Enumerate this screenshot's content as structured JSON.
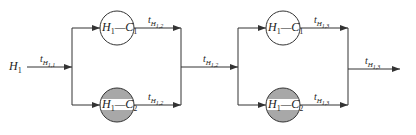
{
  "diagram": {
    "type": "series-parallel flow",
    "input": {
      "label_main": "H",
      "label_sub": "1"
    },
    "edges": {
      "input": {
        "t": "t",
        "H": "H",
        "sub": "1,1"
      },
      "stage1_top_out": {
        "t": "t",
        "H": "H",
        "sub": "1,2"
      },
      "stage1_bottom_out": {
        "t": "t",
        "H": "H",
        "sub": "1,2"
      },
      "middle": {
        "t": "t",
        "H": "H",
        "sub": "1,2"
      },
      "stage2_top_out": {
        "t": "t",
        "H": "H",
        "sub": "1,3"
      },
      "stage2_bottom_out": {
        "t": "t",
        "H": "H",
        "sub": "1,3"
      },
      "output": {
        "t": "t",
        "H": "H",
        "sub": "1,3"
      }
    },
    "stages": [
      {
        "nodes": [
          {
            "a": "H",
            "a_sub": "1",
            "sep": "—",
            "b": "C",
            "b_sub": "1",
            "fill": "#ffffff"
          },
          {
            "a": "H",
            "a_sub": "1",
            "sep": "—",
            "b": "C",
            "b_sub": "2",
            "fill": "#a8a8a8"
          }
        ]
      },
      {
        "nodes": [
          {
            "a": "H",
            "a_sub": "1",
            "sep": "—",
            "b": "C",
            "b_sub": "1",
            "fill": "#ffffff"
          },
          {
            "a": "H",
            "a_sub": "1",
            "sep": "—",
            "b": "C",
            "b_sub": "2",
            "fill": "#a8a8a8"
          }
        ]
      }
    ],
    "colors": {
      "line": "#333333",
      "shaded": "#a8a8a8",
      "band": "#ffffff"
    }
  }
}
